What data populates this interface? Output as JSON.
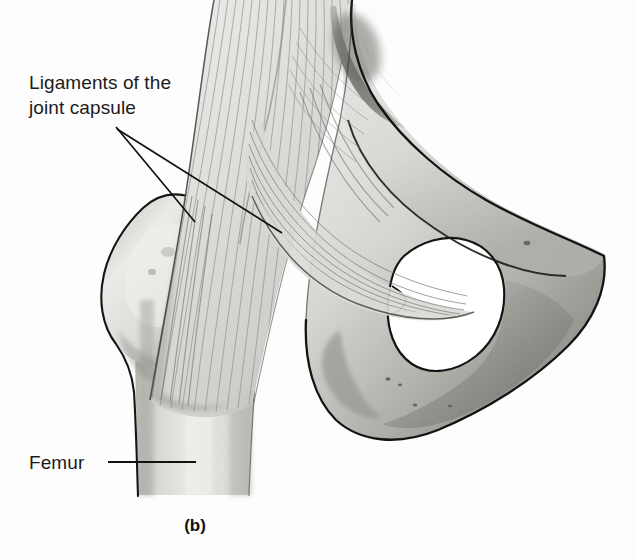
{
  "figure": {
    "caption": "(b)",
    "background_color": "#fdfdfd",
    "ink_color": "#1b1b1b"
  },
  "labels": [
    {
      "id": "ligaments",
      "text": "Ligaments of the\njoint capsule",
      "leader_style": "two-line-fan"
    },
    {
      "id": "femur",
      "text": "Femur",
      "leader_style": "horizontal-line"
    }
  ],
  "label_lookup": {
    "ligaments": "Ligaments of the\njoint capsule",
    "femur": "Femur"
  },
  "structures": {
    "femur_shaft": "Femur",
    "greater_trochanter": "Greater trochanter",
    "capsular_ligaments": "Ligaments of the joint capsule",
    "obturator_foramen": "Obturator foramen",
    "ischium": "Ischium",
    "pubis": "Pubis",
    "ilium": "Ilium"
  },
  "palette": {
    "outline": "#1a1a1a",
    "bone_light": "#e8e8e6",
    "bone_mid": "#cfcfcb",
    "bone_shadow": "#a9a9a4",
    "bone_dark": "#7d7d78",
    "fiber": "#8f8f8a",
    "white": "#ffffff"
  }
}
